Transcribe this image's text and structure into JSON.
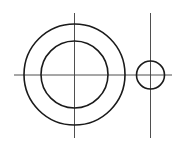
{
  "document": {
    "title": "Technical Drawing",
    "type": "engineering-line-drawing",
    "canvas": {
      "width": 187,
      "height": 149,
      "background_color": "#ffffff"
    }
  },
  "style": {
    "outline_color": "#1a1a1a",
    "outline_width": 1.6,
    "centerline_color": "#3b3b3b",
    "centerline_width": 0.9
  },
  "shapes": {
    "outer_circle": {
      "name": "outer-circle",
      "cx": 74.5,
      "cy": 74.5,
      "r": 50.5
    },
    "inner_circle": {
      "name": "inner-circle",
      "cx": 74.5,
      "cy": 74.5,
      "r": 33.5
    },
    "small_circle": {
      "name": "small-circle",
      "cx": 150.5,
      "cy": 75,
      "r": 14
    }
  },
  "centerlines": {
    "horizontal_axis": {
      "name": "horizontal-centerline",
      "x1": 14,
      "y1": 75,
      "x2": 172,
      "y2": 75
    },
    "vertical_axis_main": {
      "name": "vertical-centerline-main",
      "x1": 74.5,
      "y1": 13,
      "x2": 74.5,
      "y2": 138
    },
    "vertical_axis_small": {
      "name": "vertical-centerline-small",
      "x1": 150.5,
      "y1": 13,
      "x2": 150.5,
      "y2": 138
    }
  }
}
